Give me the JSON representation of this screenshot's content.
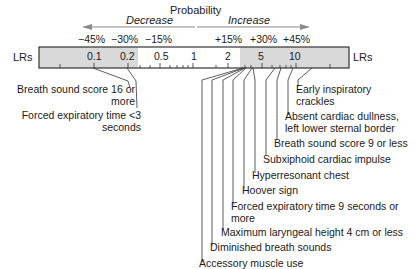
{
  "title": "Probability",
  "direction": {
    "decrease": "Decrease",
    "increase": "Increase"
  },
  "percent_labels": {
    "decrease": [
      "−45%",
      "−30%",
      "−15%"
    ],
    "increase": [
      "+15%",
      "+30%",
      "+45%"
    ]
  },
  "axis": {
    "left_label": "LRs",
    "right_label": "LRs",
    "ticks": [
      "0.1",
      "0.2",
      "0.5",
      "1",
      "2",
      "5",
      "10"
    ]
  },
  "colors": {
    "shade": "#d9d9d9",
    "arrow": "#8a8a8a",
    "line": "#333333"
  },
  "findings_left": [
    {
      "label": "Breath sound score 16 or more",
      "line1": "Breath sound score 16 or",
      "line2": "more",
      "lr": 0.1
    },
    {
      "label": "Forced expiratory time <3 seconds",
      "line1": "Forced expiratory time <3",
      "line2": "seconds",
      "lr": 0.2
    }
  ],
  "findings_right": [
    {
      "line1": "Early inspiratory",
      "line2": "crackles"
    },
    {
      "line1": "Absent cardiac dullness,",
      "line2": "left lower sternal border"
    },
    {
      "line1": "Breath sound score 9 or less"
    },
    {
      "line1": "Subxiphoid cardiac impulse"
    },
    {
      "line1": "Hyperresonant chest"
    },
    {
      "line1": "Hoover sign"
    },
    {
      "line1": "Forced expiratory time 9 seconds or",
      "line2": "more"
    },
    {
      "line1": "Maximum laryngeal height 4 cm or less"
    },
    {
      "line1": "Diminished breath sounds"
    },
    {
      "line1": "Accessory muscle use"
    }
  ]
}
